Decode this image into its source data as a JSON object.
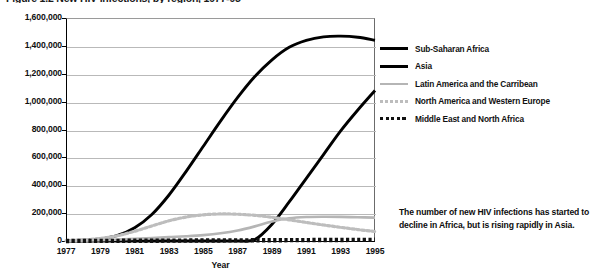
{
  "title": "Figure 1.2  New HIV infections, by region, 1977-95",
  "legend": {
    "position": "right",
    "items": [
      {
        "label": "Sub-Saharan Africa",
        "color": "#000000",
        "style": "solid",
        "width": 2.6
      },
      {
        "label": "Asia",
        "color": "#000000",
        "style": "solid",
        "width": 2.6
      },
      {
        "label": "Latin America and the Carribean",
        "color": "#b5b5b5",
        "style": "solid",
        "width": 2.2
      },
      {
        "label": "North America and Western Europe",
        "color": "#bdbdbd",
        "style": "dotted",
        "width": 2.2
      },
      {
        "label": "Middle East and North Africa",
        "color": "#111111",
        "style": "dotted",
        "width": 3.0
      }
    ]
  },
  "annotation": "The number of new HIV infections has started to decline in Africa, but is rising rapidly in Asia.",
  "chart_data": {
    "type": "line",
    "title": "Figure 1.2  New HIV infections, by region, 1977-95",
    "xlabel": "Year",
    "ylabel": "",
    "xlim": [
      1977,
      1995
    ],
    "ylim": [
      0,
      1600000
    ],
    "grid": true,
    "legend_position": "right",
    "ytick_labels": [
      "1,600,000",
      "1,400,000",
      "1,200,000",
      "1,000,000",
      "800,000",
      "600,000",
      "400,000",
      "200,000",
      "0"
    ],
    "ytick_values": [
      1600000,
      1400000,
      1200000,
      1000000,
      800000,
      600000,
      400000,
      200000,
      0
    ],
    "xtick_labels": [
      "1977",
      "1979",
      "1981",
      "1983",
      "1985",
      "1987",
      "1989",
      "1991",
      "1993",
      "1995"
    ],
    "xtick_values": [
      1977,
      1979,
      1981,
      1983,
      1985,
      1987,
      1989,
      1991,
      1993,
      1995
    ],
    "x": [
      1977,
      1978,
      1979,
      1980,
      1981,
      1982,
      1983,
      1984,
      1985,
      1986,
      1987,
      1988,
      1989,
      1990,
      1991,
      1992,
      1993,
      1994,
      1995
    ],
    "series": [
      {
        "name": "Sub-Saharan Africa",
        "color": "#000000",
        "style": "solid",
        "values": [
          2000,
          6000,
          15000,
          40000,
          95000,
          190000,
          330000,
          500000,
          680000,
          860000,
          1030000,
          1180000,
          1300000,
          1390000,
          1440000,
          1465000,
          1470000,
          1462000,
          1440000
        ]
      },
      {
        "name": "Asia",
        "color": "#000000",
        "style": "solid",
        "values": [
          0,
          0,
          0,
          0,
          0,
          0,
          0,
          0,
          0,
          0,
          0,
          10000,
          120000,
          280000,
          450000,
          620000,
          790000,
          940000,
          1080000
        ]
      },
      {
        "name": "Latin America and the Carribean",
        "color": "#b5b5b5",
        "style": "solid",
        "values": [
          1000,
          3000,
          6000,
          10000,
          16000,
          22000,
          28000,
          34000,
          42000,
          55000,
          75000,
          105000,
          140000,
          163000,
          172000,
          174000,
          173000,
          170000,
          168000
        ]
      },
      {
        "name": "North America and Western Europe",
        "color": "#bdbdbd",
        "style": "dotted",
        "values": [
          3000,
          8000,
          18000,
          38000,
          70000,
          108000,
          145000,
          172000,
          188000,
          194000,
          192000,
          184000,
          170000,
          152000,
          133000,
          115000,
          98000,
          82000,
          68000
        ]
      },
      {
        "name": "Middle East and North Africa",
        "color": "#111111",
        "style": "dotted",
        "values": [
          500,
          700,
          900,
          1200,
          1500,
          2000,
          2500,
          3000,
          3500,
          4000,
          4500,
          5000,
          5500,
          6000,
          6500,
          7000,
          7500,
          8000,
          8500
        ]
      }
    ]
  }
}
